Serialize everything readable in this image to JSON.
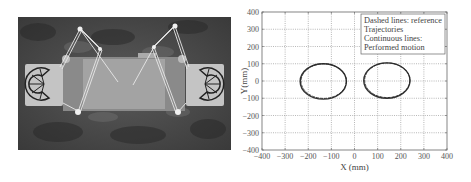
{
  "figure": {
    "left_panel": {
      "description": "Photograph of cable-driven parallel robot platform with two rotating drums"
    }
  },
  "chart_data": {
    "type": "line",
    "title": "",
    "xlabel": "X (mm)",
    "ylabel": "Y(mm)",
    "xlim": [
      -400,
      400
    ],
    "ylim": [
      -400,
      400
    ],
    "x_ticks": [
      "-400",
      "-300",
      "-200",
      "-100",
      "0",
      "100",
      "200",
      "300",
      "400"
    ],
    "y_ticks": [
      "400",
      "300",
      "200",
      "100",
      "0",
      "-100",
      "-200",
      "-300",
      "-400"
    ],
    "grid": true,
    "grid_style": "dotted",
    "legend": {
      "position": "upper right",
      "lines": [
        "Dashed lines: reference",
        "Trajectories",
        "Continuous lines:",
        "Performed motion"
      ]
    },
    "series": [
      {
        "name": "Left ellipse trajectory",
        "shape": "ellipse",
        "center": [
          -135,
          0
        ],
        "radius_x": 100,
        "radius_y": 100,
        "x_range": [
          -235,
          -35
        ],
        "y_range": [
          -105,
          100
        ]
      },
      {
        "name": "Right ellipse trajectory",
        "shape": "ellipse",
        "center": [
          140,
          0
        ],
        "radius_x": 100,
        "radius_y": 100,
        "x_range": [
          40,
          240
        ],
        "y_range": [
          -100,
          105
        ]
      }
    ]
  }
}
